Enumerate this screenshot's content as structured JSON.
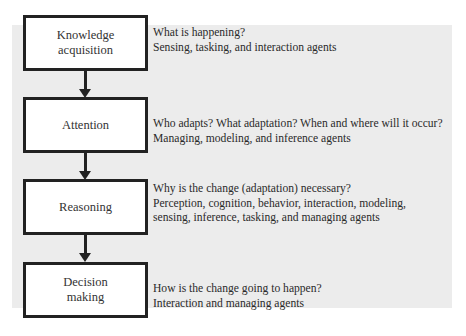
{
  "diagram": {
    "stages": [
      {
        "label_lines": [
          "Knowledge",
          "acquisition"
        ],
        "question": "What is happening?",
        "agents_lines": [
          "Sensing, tasking, and interaction agents"
        ]
      },
      {
        "label_lines": [
          "Attention"
        ],
        "question": "Who adapts? What adaptation? When and where will it occur?",
        "agents_lines": [
          "Managing, modeling, and inference agents"
        ]
      },
      {
        "label_lines": [
          "Reasoning"
        ],
        "question": "Why is the change (adaptation) necessary?",
        "agents_lines": [
          "Perception, cognition, behavior, interaction, modeling,",
          "sensing, inference, tasking, and managing agents"
        ]
      },
      {
        "label_lines": [
          "Decision",
          "making"
        ],
        "question": "How is the change going to happen?",
        "agents_lines": [
          "Interaction and managing agents"
        ]
      }
    ],
    "colors": {
      "box_border": "#222222",
      "box_fill": "#ffffff",
      "panel_bg": "#ececec",
      "text": "#2a2a2a"
    }
  }
}
